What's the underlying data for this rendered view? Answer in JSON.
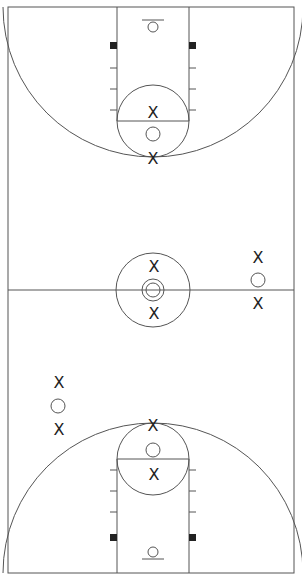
{
  "diagram": {
    "type": "basketball-full-court-play-diagram",
    "court": {
      "left": 8,
      "top": 7,
      "right": 294,
      "bottom": 573,
      "midcourt_y": 290,
      "center_x": 151
    },
    "colors": {
      "lines": "#555555",
      "marks": "#222222",
      "background": "#ffffff"
    },
    "top_half": {
      "lane": {
        "x1": 117,
        "x2": 189,
        "y_end": 121
      },
      "free_throw_circle": {
        "cx": 153,
        "cy": 121,
        "r": 36
      },
      "three_point_arc": {
        "cx": 153,
        "cy": 7,
        "r": 150
      },
      "basket": {
        "cx": 153,
        "cy": 27,
        "r": 5
      },
      "backboard": {
        "x1": 142,
        "x2": 164,
        "y": 20
      },
      "blocks": [
        {
          "x": 110,
          "y": 42
        },
        {
          "x": 189,
          "y": 42
        }
      ],
      "hash_marks_y": [
        68,
        89,
        110
      ]
    },
    "bottom_half": {
      "lane": {
        "x1": 117,
        "x2": 189,
        "y_end": 459
      },
      "free_throw_circle": {
        "cx": 153,
        "cy": 459,
        "r": 36
      },
      "three_point_arc": {
        "cx": 153,
        "cy": 573,
        "r": 150
      },
      "basket": {
        "cx": 153,
        "cy": 552,
        "r": 5
      },
      "backboard": {
        "x1": 142,
        "x2": 164,
        "y": 559
      },
      "blocks": [
        {
          "x": 110,
          "y": 534
        },
        {
          "x": 189,
          "y": 534
        }
      ],
      "hash_marks_y": [
        470,
        491,
        512
      ]
    },
    "center_circle": {
      "cx": 153,
      "cy": 290,
      "r_outer": 37,
      "r_inner_outer": 11,
      "r_inner": 7
    },
    "players": [
      {
        "label": "X",
        "x": 153,
        "y": 112
      },
      {
        "label": "X",
        "x": 153,
        "y": 158
      },
      {
        "label": "X",
        "x": 154,
        "y": 266
      },
      {
        "label": "X",
        "x": 154,
        "y": 313
      },
      {
        "label": "X",
        "x": 258,
        "y": 257
      },
      {
        "label": "X",
        "x": 258,
        "y": 303
      },
      {
        "label": "X",
        "x": 59,
        "y": 382
      },
      {
        "label": "X",
        "x": 59,
        "y": 429
      },
      {
        "label": "X",
        "x": 153,
        "y": 425
      },
      {
        "label": "X",
        "x": 154,
        "y": 474
      }
    ],
    "offense_circles": [
      {
        "x": 153,
        "y": 134,
        "r": 7
      },
      {
        "x": 258,
        "y": 280,
        "r": 7
      },
      {
        "x": 58,
        "y": 406,
        "r": 7
      },
      {
        "x": 153,
        "y": 450,
        "r": 7
      }
    ]
  }
}
